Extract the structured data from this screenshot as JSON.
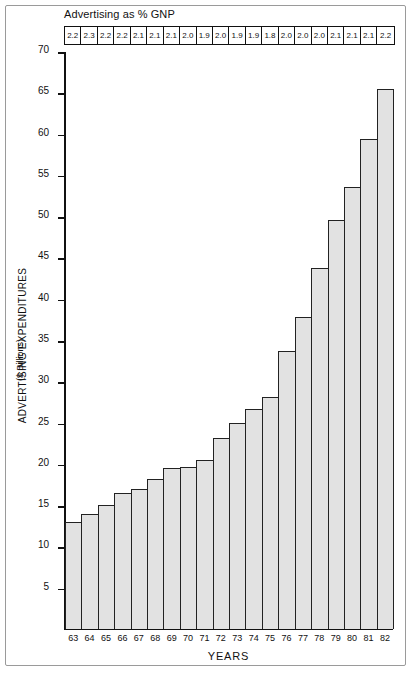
{
  "chart_data": {
    "type": "bar",
    "title": "",
    "xlabel": "YEARS",
    "ylabel": "ADVERTISING EXPENDITURES",
    "ylabel_sub": "($ Billions)",
    "ylim": [
      0,
      70
    ],
    "yticks": [
      70,
      65,
      60,
      55,
      50,
      45,
      40,
      35,
      30,
      25,
      20,
      15,
      10,
      5
    ],
    "grid": false,
    "legend": "none",
    "categories": [
      "63",
      "64",
      "65",
      "66",
      "67",
      "68",
      "69",
      "70",
      "71",
      "72",
      "73",
      "74",
      "75",
      "76",
      "77",
      "78",
      "79",
      "80",
      "81",
      "82"
    ],
    "values": [
      13.0,
      13.9,
      15.1,
      16.5,
      17.0,
      18.2,
      19.5,
      19.6,
      20.5,
      23.2,
      25.0,
      26.7,
      28.2,
      33.7,
      37.8,
      43.8,
      49.6,
      53.6,
      59.4,
      65.5
    ],
    "annotation_row": {
      "label": "Advertising as % GNP",
      "values": [
        "2.2",
        "2.3",
        "2.2",
        "2.2",
        "2.1",
        "2.1",
        "2.1",
        "2.0",
        "1.9",
        "2.0",
        "1.9",
        "1.9",
        "1.8",
        "2.0",
        "2.0",
        "2.0",
        "2.1",
        "2.1",
        "2.1",
        "2.2"
      ]
    },
    "colors": {
      "bar_fill": "#e2e2e2",
      "bar_stroke": "#222222",
      "axis": "#111111",
      "frame": "#9a9a9a",
      "background": "#ffffff"
    }
  }
}
